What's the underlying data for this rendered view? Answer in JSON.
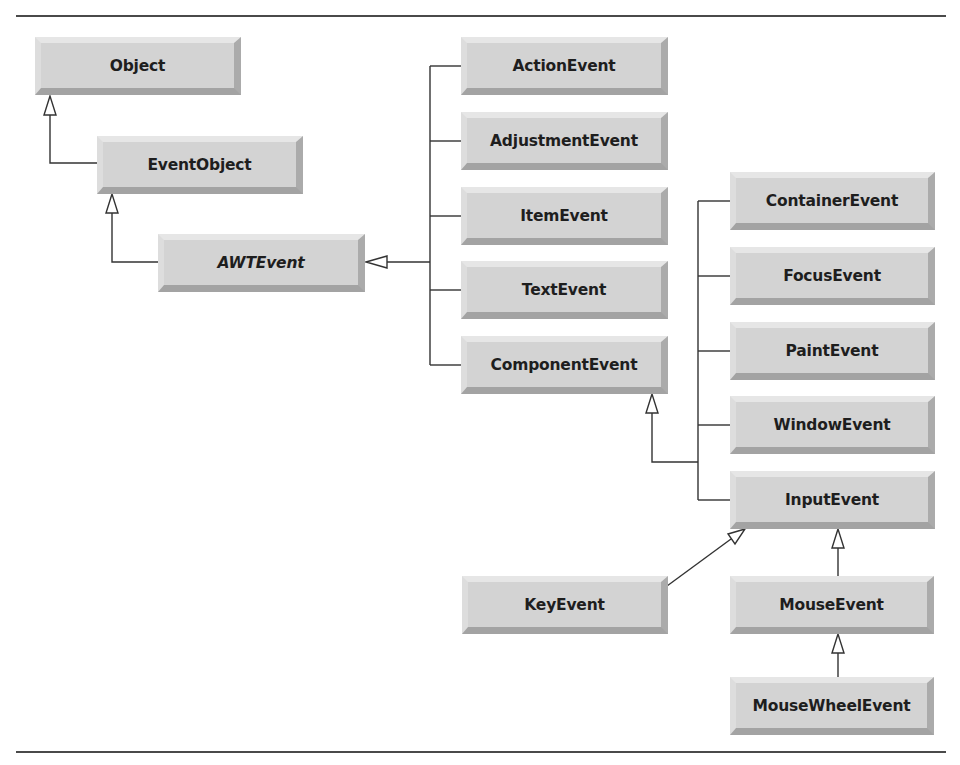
{
  "diagram": {
    "type": "class-hierarchy",
    "nodes": [
      {
        "id": "object",
        "label": "Object",
        "abstract": false
      },
      {
        "id": "eventobject",
        "label": "EventObject",
        "abstract": false
      },
      {
        "id": "awtevent",
        "label": "AWTEvent",
        "abstract": true
      },
      {
        "id": "actionevent",
        "label": "ActionEvent",
        "abstract": false
      },
      {
        "id": "adjustmentevent",
        "label": "AdjustmentEvent",
        "abstract": false
      },
      {
        "id": "itemevent",
        "label": "ItemEvent",
        "abstract": false
      },
      {
        "id": "textevent",
        "label": "TextEvent",
        "abstract": false
      },
      {
        "id": "componentevent",
        "label": "ComponentEvent",
        "abstract": false
      },
      {
        "id": "containerevent",
        "label": "ContainerEvent",
        "abstract": false
      },
      {
        "id": "focusevent",
        "label": "FocusEvent",
        "abstract": false
      },
      {
        "id": "paintevent",
        "label": "PaintEvent",
        "abstract": false
      },
      {
        "id": "windowevent",
        "label": "WindowEvent",
        "abstract": false
      },
      {
        "id": "inputevent",
        "label": "InputEvent",
        "abstract": false
      },
      {
        "id": "keyevent",
        "label": "KeyEvent",
        "abstract": false
      },
      {
        "id": "mouseevent",
        "label": "MouseEvent",
        "abstract": false
      },
      {
        "id": "mousewheelevent",
        "label": "MouseWheelEvent",
        "abstract": false
      }
    ],
    "edges": [
      {
        "from": "EventObject",
        "to": "Object",
        "kind": "inheritance"
      },
      {
        "from": "AWTEvent",
        "to": "EventObject",
        "kind": "inheritance"
      },
      {
        "from": "ActionEvent",
        "to": "AWTEvent",
        "kind": "inheritance"
      },
      {
        "from": "AdjustmentEvent",
        "to": "AWTEvent",
        "kind": "inheritance"
      },
      {
        "from": "ItemEvent",
        "to": "AWTEvent",
        "kind": "inheritance"
      },
      {
        "from": "TextEvent",
        "to": "AWTEvent",
        "kind": "inheritance"
      },
      {
        "from": "ComponentEvent",
        "to": "AWTEvent",
        "kind": "inheritance"
      },
      {
        "from": "ContainerEvent",
        "to": "ComponentEvent",
        "kind": "inheritance"
      },
      {
        "from": "FocusEvent",
        "to": "ComponentEvent",
        "kind": "inheritance"
      },
      {
        "from": "PaintEvent",
        "to": "ComponentEvent",
        "kind": "inheritance"
      },
      {
        "from": "WindowEvent",
        "to": "ComponentEvent",
        "kind": "inheritance"
      },
      {
        "from": "InputEvent",
        "to": "ComponentEvent",
        "kind": "inheritance"
      },
      {
        "from": "KeyEvent",
        "to": "InputEvent",
        "kind": "inheritance"
      },
      {
        "from": "MouseEvent",
        "to": "InputEvent",
        "kind": "inheritance"
      },
      {
        "from": "MouseWheelEvent",
        "to": "MouseEvent",
        "kind": "inheritance"
      }
    ],
    "colors": {
      "box_face": "#d3d3d3",
      "line": "#333333",
      "text": "#1e1e1e"
    }
  }
}
